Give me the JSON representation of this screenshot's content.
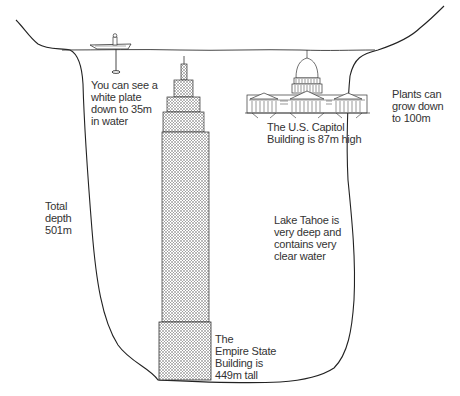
{
  "diagram": {
    "labels": {
      "white_plate": "You can see a\nwhite plate\ndown to 35m\nin water",
      "plants": "Plants can\ngrow down\nto 100m",
      "capitol": "The U.S. Capitol\nBuilding is 87m high",
      "total_depth": "Total\ndepth\n501m",
      "lake_tahoe": "Lake Tahoe is\nvery deep and\ncontains very\nclear water",
      "empire_state": "The\nEmpire State\nBuilding is\n449m tall"
    },
    "figures": {
      "boat": "boat-with-person",
      "secchi_disk": "white-plate-on-line",
      "capitol": "us-capitol-building",
      "empire_state": "empire-state-building"
    },
    "colors": {
      "line": "#222222",
      "text": "#333333",
      "stipple": "#555555",
      "background": "#ffffff"
    },
    "measurements": {
      "white_plate_visibility_m": 35,
      "plant_depth_m": 100,
      "capitol_height_m": 87,
      "total_depth_m": 501,
      "empire_state_height_m": 449
    }
  }
}
